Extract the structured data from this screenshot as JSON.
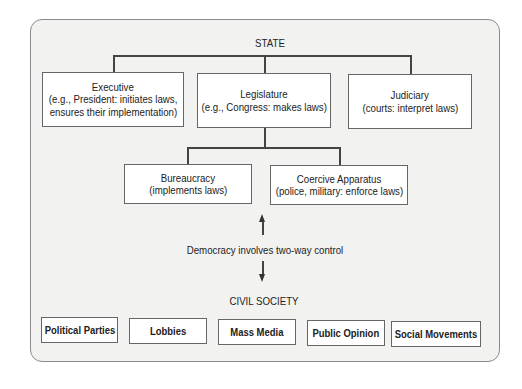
{
  "diagram": {
    "title": "STATE",
    "branches": [
      {
        "name": "Executive",
        "detail_1": "(e.g., President: initiates laws,",
        "detail_2": "ensures their implementation)"
      },
      {
        "name": "Legislature",
        "detail_1": "(e.g., Congress: makes laws)"
      },
      {
        "name": "Judiciary",
        "detail_1": "(courts: interpret laws)"
      }
    ],
    "sub_branches": [
      {
        "name": "Bureaucracy",
        "detail_1": "(implements laws)"
      },
      {
        "name": "Coercive Apparatus",
        "detail_1": "(police, military: enforce laws)"
      }
    ],
    "control_label": "Democracy involves two-way control",
    "civil_society_title": "CIVIL SOCIETY",
    "civil_society_items": [
      "Political Parties",
      "Lobbies",
      "Mass Media",
      "Public Opinion",
      "Social Movements"
    ]
  }
}
